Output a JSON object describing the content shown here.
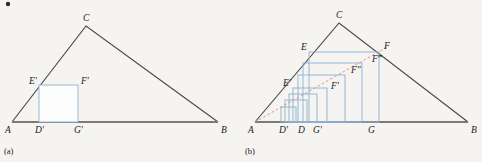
{
  "figure": {
    "background_color": "#f6f4f1",
    "line_color": "#4a4a4a",
    "base_color": "#7d7a76",
    "square_color": "#8fb4d4",
    "dashed_ray_color": "#dd8a8a"
  },
  "panel_a": {
    "caption": "(a)",
    "description": "Triangle ABC with one inscribed square E'D'G'F'",
    "vertices": {
      "A": {
        "label": "A",
        "x": 12,
        "y": 122
      },
      "B": {
        "label": "B",
        "x": 218,
        "y": 122
      },
      "C": {
        "label": "C",
        "x": 86,
        "y": 26
      }
    },
    "vertex_labels": [
      {
        "name": "A",
        "label": "A",
        "tx": 5,
        "ty": 133
      },
      {
        "name": "B",
        "label": "B",
        "tx": 221,
        "ty": 133
      },
      {
        "name": "C",
        "label": "C",
        "tx": 83,
        "ty": 21
      }
    ],
    "square": {
      "name": "square-EDGF-prime",
      "left": 39,
      "right": 78,
      "top": 85,
      "bottom": 122,
      "corners": [
        {
          "name": "E-prime",
          "label": "E′",
          "tx": 29,
          "ty": 84
        },
        {
          "name": "F-prime",
          "label": "F′",
          "tx": 81,
          "ty": 84
        },
        {
          "name": "D-prime",
          "label": "D′",
          "tx": 35,
          "ty": 133
        },
        {
          "name": "G-prime",
          "label": "G′",
          "tx": 74,
          "ty": 133
        }
      ]
    }
  },
  "panel_b": {
    "caption": "(b)",
    "description": "Triangle ABC with a nested family of squares and a dashed ray from A through F′, F″, F‴ to F",
    "vertices": {
      "A": {
        "label": "A",
        "x": 14,
        "y": 122
      },
      "B": {
        "label": "B",
        "x": 227,
        "y": 122
      },
      "C": {
        "label": "C",
        "x": 98,
        "y": 23
      }
    },
    "vertex_labels": [
      {
        "name": "A",
        "label": "A",
        "tx": 7,
        "ty": 133
      },
      {
        "name": "B",
        "label": "B",
        "tx": 230,
        "ty": 133
      },
      {
        "name": "C",
        "label": "C",
        "tx": 95,
        "ty": 18
      }
    ],
    "squares": [
      {
        "name": "square-1-smallest",
        "left": 40,
        "right": 55,
        "top": 107,
        "bottom": 122
      },
      {
        "name": "square-2",
        "left": 44,
        "right": 66,
        "top": 100,
        "bottom": 122
      },
      {
        "name": "square-3",
        "left": 48,
        "right": 76,
        "top": 94,
        "bottom": 122
      },
      {
        "name": "square-4-EDGF-prime",
        "left": 52,
        "right": 86,
        "top": 88,
        "bottom": 122
      },
      {
        "name": "square-5",
        "left": 57,
        "right": 104,
        "top": 75,
        "bottom": 122
      },
      {
        "name": "square-6",
        "left": 62,
        "right": 121,
        "top": 63,
        "bottom": 122
      },
      {
        "name": "square-7-EDGF",
        "left": 68,
        "right": 138,
        "top": 52,
        "bottom": 122
      }
    ],
    "dashed_ray": {
      "name": "ray-A-to-F",
      "x1": 14,
      "y1": 122,
      "x2": 144,
      "y2": 48
    },
    "point_labels": [
      {
        "name": "E-prime",
        "label": "E′",
        "tx": 42,
        "ty": 86
      },
      {
        "name": "E",
        "label": "E",
        "tx": 60,
        "ty": 50
      },
      {
        "name": "F",
        "label": "F",
        "tx": 143,
        "ty": 49
      },
      {
        "name": "F-prime",
        "label": "F′",
        "tx": 90,
        "ty": 89
      },
      {
        "name": "F-double-prime",
        "label": "F″",
        "tx": 110,
        "ty": 73
      },
      {
        "name": "F-triple-prime",
        "label": "F‴",
        "tx": 132,
        "ty": 62
      }
    ],
    "baseline_labels": [
      {
        "name": "D-prime",
        "label": "D′",
        "tx": 38,
        "ty": 133
      },
      {
        "name": "D",
        "label": "D",
        "tx": 57,
        "ty": 133
      },
      {
        "name": "G-prime",
        "label": "G′",
        "tx": 73,
        "ty": 133
      },
      {
        "name": "G",
        "label": "G",
        "tx": 128,
        "ty": 133
      }
    ]
  }
}
